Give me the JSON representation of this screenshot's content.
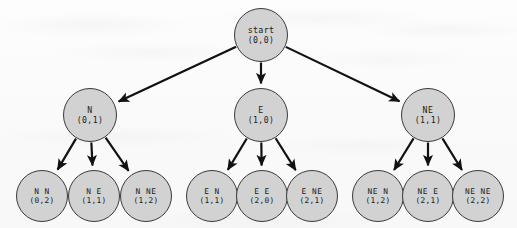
{
  "figure": {
    "type": "tree-diagram",
    "width": 517,
    "height": 228,
    "background_color": "#fbfbfb",
    "node_fill_color": "#d2d2d2",
    "node_border_color": "#3a3a3a",
    "edge_color": "#111111",
    "text_color": "#1a1a1a"
  },
  "nodes": [
    {
      "id": "start",
      "level": 0,
      "label": "start",
      "coord": "(0,0)",
      "cx": 261,
      "cy": 35,
      "r": 27
    },
    {
      "id": "n",
      "level": 1,
      "label": "N",
      "coord": "(0,1)",
      "cx": 90,
      "cy": 115,
      "r": 27
    },
    {
      "id": "e",
      "level": 1,
      "label": "E",
      "coord": "(1,0)",
      "cx": 261,
      "cy": 115,
      "r": 27
    },
    {
      "id": "ne",
      "level": 1,
      "label": "NE",
      "coord": "(1,1)",
      "cx": 428,
      "cy": 115,
      "r": 27
    },
    {
      "id": "n-n",
      "level": 2,
      "label": "N N",
      "coord": "(0,2)",
      "cx": 42,
      "cy": 196,
      "r": 26
    },
    {
      "id": "n-e",
      "level": 2,
      "label": "N E",
      "coord": "(1,1)",
      "cx": 94,
      "cy": 196,
      "r": 26
    },
    {
      "id": "n-ne",
      "level": 2,
      "label": "N NE",
      "coord": "(1,2)",
      "cx": 146,
      "cy": 196,
      "r": 26
    },
    {
      "id": "e-n",
      "level": 2,
      "label": "E N",
      "coord": "(1,1)",
      "cx": 212,
      "cy": 196,
      "r": 26
    },
    {
      "id": "e-e",
      "level": 2,
      "label": "E E",
      "coord": "(2,0)",
      "cx": 262,
      "cy": 196,
      "r": 26
    },
    {
      "id": "e-ne",
      "level": 2,
      "label": "E NE",
      "coord": "(2,1)",
      "cx": 312,
      "cy": 196,
      "r": 26
    },
    {
      "id": "ne-n",
      "level": 2,
      "label": "NE N",
      "coord": "(1,2)",
      "cx": 378,
      "cy": 196,
      "r": 26
    },
    {
      "id": "ne-e",
      "level": 2,
      "label": "NE E",
      "coord": "(2,1)",
      "cx": 428,
      "cy": 196,
      "r": 26
    },
    {
      "id": "ne-ne",
      "level": 2,
      "label": "NE NE",
      "coord": "(2,2)",
      "cx": 478,
      "cy": 196,
      "r": 26
    }
  ],
  "edges": [
    {
      "from": "start",
      "to": "n"
    },
    {
      "from": "start",
      "to": "e"
    },
    {
      "from": "start",
      "to": "ne"
    },
    {
      "from": "n",
      "to": "n-n"
    },
    {
      "from": "n",
      "to": "n-e"
    },
    {
      "from": "n",
      "to": "n-ne"
    },
    {
      "from": "e",
      "to": "e-n"
    },
    {
      "from": "e",
      "to": "e-e"
    },
    {
      "from": "e",
      "to": "e-ne"
    },
    {
      "from": "ne",
      "to": "ne-n"
    },
    {
      "from": "ne",
      "to": "ne-e"
    },
    {
      "from": "ne",
      "to": "ne-ne"
    }
  ]
}
